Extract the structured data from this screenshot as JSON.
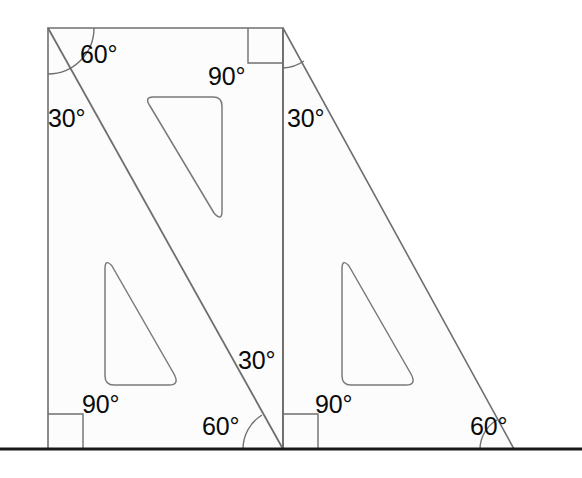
{
  "figure": {
    "degree_symbol": "°",
    "colors": {
      "background": "#ffffff",
      "plate_fill": "#fcfcfc",
      "plate_stroke": "#6f6f6f",
      "cutout_stroke": "#7a7a7a",
      "ground_line": "#1a1a1a",
      "arc_stroke": "#6f6f6f",
      "label_text": "#0a0a0a"
    },
    "ground_line": {
      "name": "ground-line",
      "y": 449,
      "x_start": 0,
      "x_end": 582,
      "thickness": 3
    }
  },
  "shapes": {
    "left_plate": {
      "name": "left-set-square",
      "description": "Rectangle-framed left triangle plate with vertical left edge",
      "points": "48,28 283,28 283,449 48,449",
      "diagonal": {
        "x1": 48,
        "y1": 28,
        "x2": 283,
        "y2": 449
      }
    },
    "right_plate": {
      "name": "right-set-square",
      "description": "Right triangle plate leaning to the right",
      "points": "283,28 514,449 283,449"
    },
    "cutouts": [
      {
        "name": "cutout-top",
        "points": "153,97 222,97 222,220",
        "radius": 9
      },
      {
        "name": "cutout-left",
        "points": "105,260 105,385 175,385",
        "radius": 9
      },
      {
        "name": "cutout-right",
        "points": "342,260 412,385 342,385",
        "radius": 9
      }
    ]
  },
  "angle_markers": [
    {
      "name": "angle-arc-top-left-60",
      "cx": 48,
      "cy": 28,
      "r": 46,
      "start_deg": 0,
      "end_deg": 60
    },
    {
      "name": "angle-arc-top-right-30",
      "cx": 283,
      "cy": 28,
      "r": 40,
      "start_deg": 0,
      "end_deg": 28
    },
    {
      "name": "angle-arc-bottom-center-60",
      "cx": 283,
      "cy": 449,
      "r": 40
    },
    {
      "name": "angle-arc-bottom-right-60",
      "cx": 514,
      "cy": 449,
      "r": 34
    },
    {
      "name": "right-angle-square-top-right",
      "x": 248,
      "y": 28,
      "size": 35
    },
    {
      "name": "right-angle-square-bottom-left",
      "x": 48,
      "y": 414,
      "size": 35
    },
    {
      "name": "right-angle-square-bottom-center",
      "x": 283,
      "y": 414,
      "size": 35
    }
  ],
  "labels": [
    {
      "name": "label-60-top-left",
      "text": "60°",
      "x": 80,
      "y": 42,
      "angle": 60,
      "vertex": "top-left"
    },
    {
      "name": "label-90-top-right",
      "text": "90°",
      "x": 208,
      "y": 64,
      "angle": 90,
      "vertex": "top-right-of-left-plate"
    },
    {
      "name": "label-30-left",
      "text": "30°",
      "x": 48,
      "y": 106,
      "angle": 30,
      "vertex": "left-edge"
    },
    {
      "name": "label-30-right-plate",
      "text": "30°",
      "x": 287,
      "y": 106,
      "angle": 30,
      "vertex": "right-plate-apex"
    },
    {
      "name": "label-30-center",
      "text": "30°",
      "x": 238,
      "y": 348,
      "angle": 30,
      "vertex": "center-lower"
    },
    {
      "name": "label-90-bottom-left",
      "text": "90°",
      "x": 82,
      "y": 392,
      "angle": 90,
      "vertex": "bottom-left"
    },
    {
      "name": "label-60-bottom-center",
      "text": "60°",
      "x": 202,
      "y": 414,
      "angle": 60,
      "vertex": "bottom-center"
    },
    {
      "name": "label-90-bottom-right",
      "text": "90°",
      "x": 315,
      "y": 392,
      "angle": 90,
      "vertex": "bottom-center-right"
    },
    {
      "name": "label-60-bottom-far-right",
      "text": "60°",
      "x": 470,
      "y": 414,
      "angle": 60,
      "vertex": "bottom-right"
    }
  ]
}
